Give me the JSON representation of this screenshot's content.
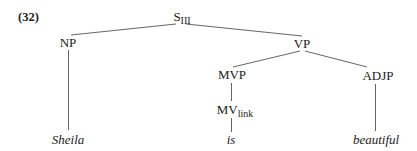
{
  "example_number": "(32)",
  "tree": {
    "root": {
      "label": "S",
      "subscript": "III"
    },
    "np": {
      "label": "NP"
    },
    "vp": {
      "label": "VP"
    },
    "mvp": {
      "label": "MVP"
    },
    "mv": {
      "label": "MV",
      "subscript": "link"
    },
    "adjp": {
      "label": "ADJP"
    },
    "words": {
      "subject": "Sheila",
      "verb": "is",
      "adjective": "beautiful"
    }
  },
  "edges": [
    [
      "S_III",
      "NP"
    ],
    [
      "S_III",
      "VP"
    ],
    [
      "VP",
      "MVP"
    ],
    [
      "VP",
      "ADJP"
    ],
    [
      "MVP",
      "MV_link"
    ],
    [
      "NP",
      "Sheila"
    ],
    [
      "MV_link",
      "is"
    ],
    [
      "ADJP",
      "beautiful"
    ]
  ],
  "colors": {
    "line": "#555555",
    "text": "#222222"
  }
}
